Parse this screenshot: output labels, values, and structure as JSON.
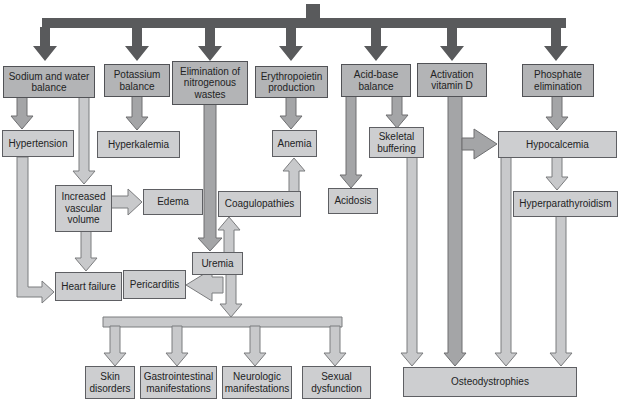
{
  "diagram": {
    "type": "flowchart",
    "colors": {
      "background": "#ffffff",
      "trunk_bar": "#595a5c",
      "primary_box_fill": "#b3b4b6",
      "secondary_box_fill": "#cdced0",
      "box_border": "#55565a",
      "arrow_medium_fill": "#a4a5a7",
      "arrow_light_fill": "#c8c9cb",
      "arrow_outline": "#77787b",
      "text": "#222324"
    }
  },
  "nodes": {
    "sodium": {
      "label": "Sodium and water balance"
    },
    "potassium": {
      "label": "Potassium balance"
    },
    "elimination": {
      "label": "Elimination of nitrogenous wastes"
    },
    "erythropoietin": {
      "label": "Erythropoietin production"
    },
    "acid_base": {
      "label": "Acid-base balance"
    },
    "vitamin_d": {
      "label": "Activation vitamin D"
    },
    "phosphate": {
      "label": "Phosphate elimination"
    },
    "hypertension": {
      "label": "Hypertension"
    },
    "hyperkalemia": {
      "label": "Hyperkalemia"
    },
    "anemia": {
      "label": "Anemia"
    },
    "skeletal_buffering": {
      "label": "Skeletal buffering"
    },
    "hypocalcemia": {
      "label": "Hypocalcemia"
    },
    "increased_volume": {
      "label": "Increased vascular volume"
    },
    "edema": {
      "label": "Edema"
    },
    "coagulopathies": {
      "label": "Coagulopathies"
    },
    "acidosis": {
      "label": "Acidosis"
    },
    "hyperparathyroidism": {
      "label": "Hyperparathyroidism"
    },
    "uremia": {
      "label": "Uremia"
    },
    "heart_failure": {
      "label": "Heart failure"
    },
    "pericarditis": {
      "label": "Pericarditis"
    },
    "skin": {
      "label": "Skin disorders"
    },
    "gastrointestinal": {
      "label": "Gastrointestinal manifestations"
    },
    "neurologic": {
      "label": "Neurologic manifestations"
    },
    "sexual": {
      "label": "Sexual dysfunction"
    },
    "osteodystrophies": {
      "label": "Osteodystrophies"
    }
  },
  "edges": [
    {
      "from": "trunk",
      "to": "sodium"
    },
    {
      "from": "trunk",
      "to": "potassium"
    },
    {
      "from": "trunk",
      "to": "elimination"
    },
    {
      "from": "trunk",
      "to": "erythropoietin"
    },
    {
      "from": "trunk",
      "to": "acid_base"
    },
    {
      "from": "trunk",
      "to": "vitamin_d"
    },
    {
      "from": "trunk",
      "to": "phosphate"
    },
    {
      "from": "sodium",
      "to": "hypertension"
    },
    {
      "from": "sodium",
      "to": "increased_volume"
    },
    {
      "from": "hypertension",
      "to": "heart_failure"
    },
    {
      "from": "increased_volume",
      "to": "edema"
    },
    {
      "from": "increased_volume",
      "to": "heart_failure"
    },
    {
      "from": "potassium",
      "to": "hyperkalemia"
    },
    {
      "from": "elimination",
      "to": "uremia"
    },
    {
      "from": "uremia",
      "to": "coagulopathies"
    },
    {
      "from": "coagulopathies",
      "to": "anemia"
    },
    {
      "from": "erythropoietin",
      "to": "anemia"
    },
    {
      "from": "uremia",
      "to": "pericarditis"
    },
    {
      "from": "uremia",
      "to": "skin"
    },
    {
      "from": "uremia",
      "to": "gastrointestinal"
    },
    {
      "from": "uremia",
      "to": "neurologic"
    },
    {
      "from": "uremia",
      "to": "sexual"
    },
    {
      "from": "acid_base",
      "to": "acidosis"
    },
    {
      "from": "acid_base",
      "to": "skeletal_buffering"
    },
    {
      "from": "skeletal_buffering",
      "to": "osteodystrophies"
    },
    {
      "from": "vitamin_d",
      "to": "hypocalcemia"
    },
    {
      "from": "vitamin_d",
      "to": "osteodystrophies"
    },
    {
      "from": "phosphate",
      "to": "hypocalcemia"
    },
    {
      "from": "hypocalcemia",
      "to": "hyperparathyroidism"
    },
    {
      "from": "hypocalcemia",
      "to": "osteodystrophies"
    },
    {
      "from": "hyperparathyroidism",
      "to": "osteodystrophies"
    }
  ]
}
